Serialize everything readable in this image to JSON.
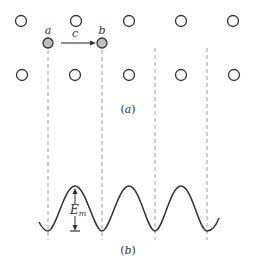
{
  "figure": {
    "panel_a": {
      "caption": "(a)",
      "caption_open": "(",
      "caption_letter": "a",
      "caption_close": ")",
      "top_row_circles_x": [
        21,
        76,
        129,
        181,
        233
      ],
      "top_row_y": 21,
      "bottom_row_circles_x": [
        22,
        75,
        129,
        181,
        234
      ],
      "bottom_row_y": 75,
      "filled_sites": [
        {
          "label": "a",
          "x": 48,
          "y": 43
        },
        {
          "label": "b",
          "x": 102,
          "y": 43
        }
      ],
      "jump_label": "c",
      "dashed_lines_x": [
        48,
        102,
        155,
        207
      ]
    },
    "panel_b": {
      "caption_open": "(",
      "caption_letter": "b",
      "caption_close": ")",
      "energy_label_main": "E",
      "energy_label_sub": "m",
      "minima_x": [
        48,
        102,
        155,
        207
      ],
      "maxima_x": [
        75,
        129,
        181
      ]
    },
    "colors": {
      "stroke": "#333333",
      "filled_site": "#bdbdbd",
      "dashed": "#888888"
    }
  }
}
